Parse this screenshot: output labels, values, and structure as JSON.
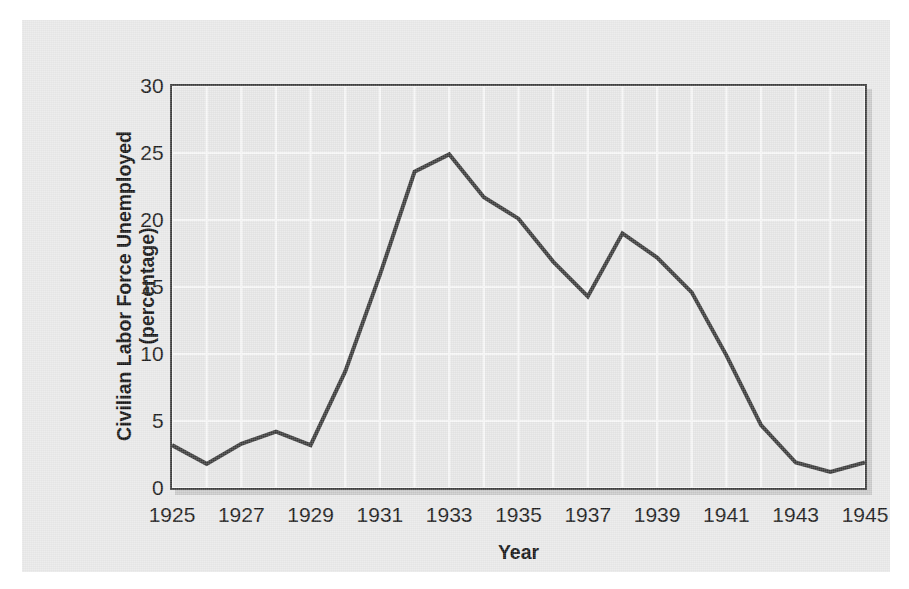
{
  "chart_data": {
    "type": "line",
    "title": "",
    "xlabel": "Year",
    "ylabel": "Civilian Labor Force Unemployed (percentage)",
    "ylabel_line1": "Civilian Labor Force Unemployed",
    "ylabel_line2": "(percentage)",
    "xlim": [
      1925,
      1945
    ],
    "ylim": [
      0,
      30
    ],
    "y_ticks": [
      0,
      5,
      10,
      15,
      20,
      25,
      30
    ],
    "y_tick_labels": [
      "0",
      "5",
      "10",
      "15",
      "20",
      "25",
      "30"
    ],
    "x_ticks": [
      1925,
      1927,
      1929,
      1931,
      1933,
      1935,
      1937,
      1939,
      1941,
      1943,
      1945
    ],
    "x_tick_labels": [
      "1925",
      "1927",
      "1929",
      "1931",
      "1933",
      "1935",
      "1937",
      "1939",
      "1941",
      "1943",
      "1945"
    ],
    "grid": true,
    "grid_color": "#f7f7f7",
    "grid_minor_x_step": 1,
    "grid_major_y_step": 5,
    "legend": null,
    "line_color": "#3a3a3a",
    "line_width": 4,
    "plot_background": "#e6e6e6",
    "figure_background": "#e9e9e9",
    "frame_color": "#3d3d3d",
    "x": [
      1925,
      1926,
      1927,
      1928,
      1929,
      1930,
      1931,
      1932,
      1933,
      1934,
      1935,
      1936,
      1937,
      1938,
      1939,
      1940,
      1941,
      1942,
      1943,
      1944,
      1945
    ],
    "values": [
      3.2,
      1.8,
      3.3,
      4.2,
      3.2,
      8.7,
      15.9,
      23.6,
      24.9,
      21.7,
      20.1,
      16.9,
      14.3,
      19.0,
      17.2,
      14.6,
      9.9,
      4.7,
      1.9,
      1.2,
      1.9
    ],
    "series": [
      {
        "name": "Civilian Labor Force Unemployed",
        "values": [
          3.2,
          1.8,
          3.3,
          4.2,
          3.2,
          8.7,
          15.9,
          23.6,
          24.9,
          21.7,
          20.1,
          16.9,
          14.3,
          19.0,
          17.2,
          14.6,
          9.9,
          4.7,
          1.9,
          1.2,
          1.9
        ]
      }
    ]
  }
}
